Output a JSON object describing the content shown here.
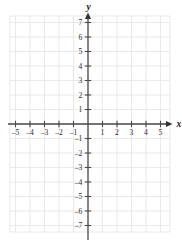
{
  "figure": {
    "kind": "cartesian-coordinate-plane",
    "background_color": "#ffffff",
    "grid_color": "#e3e3e3",
    "axis_color": "#4a4a4a",
    "label_color": "#2b2b2b",
    "width": 182,
    "height": 248
  },
  "axes": {
    "x_axis_name": "x",
    "y_axis_name": "y",
    "x_arrow": "right-arrowhead",
    "y_arrow": "up-arrowhead"
  },
  "chart_data": {
    "type": "scatter",
    "title": "",
    "subtitle": "",
    "xlabel": "x",
    "ylabel": "y",
    "grid": true,
    "legend": "none",
    "series": [],
    "x": [],
    "values": [],
    "xlim": [
      -5.9,
      5.9
    ],
    "ylim": [
      -7.9,
      7.9
    ],
    "x_ticks": [
      -5,
      -4,
      -3,
      -2,
      -1,
      1,
      2,
      3,
      4,
      5
    ],
    "y_ticks": [
      7,
      6,
      5,
      4,
      3,
      2,
      1,
      -1,
      -2,
      -3,
      -4,
      -5,
      -6,
      -7
    ],
    "x_tick_labels": [
      "-5",
      "-4",
      "-3",
      "-2",
      "-1",
      "1",
      "2",
      "3",
      "4",
      "5"
    ],
    "y_tick_labels": [
      "7",
      "6",
      "5",
      "4",
      "3",
      "2",
      "1",
      "-1",
      "-2",
      "-3",
      "-4",
      "-5",
      "-6",
      "-7"
    ],
    "x_tick_step": 1,
    "y_tick_step": 1,
    "origin_label": "",
    "annotations": []
  },
  "geometry": {
    "origin_px": {
      "x": 88,
      "y": 124
    },
    "unit_px": 14.5,
    "grid_left_px": 10,
    "grid_right_px": 170,
    "grid_top_px": 16,
    "grid_bottom_px": 232
  }
}
